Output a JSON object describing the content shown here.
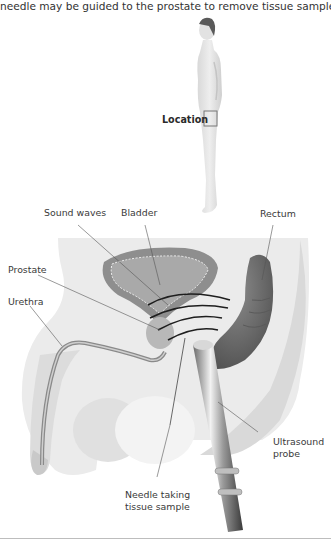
{
  "caption": "needle may be guided to the prostate to remove tissue samples.",
  "figure": {
    "location_label": "Location",
    "labels": {
      "sound_waves": "Sound waves",
      "bladder": "Bladder",
      "rectum": "Rectum",
      "prostate": "Prostate",
      "urethra": "Urethra",
      "ultrasound_probe_line1": "Ultrasound",
      "ultrasound_probe_line2": "probe",
      "needle_line1": "Needle taking",
      "needle_line2": "tissue sample"
    },
    "colors": {
      "body_fill": "#e6e6e6",
      "tissue_fill": "#d2d2d2",
      "organ_fill": "#8a8a8a",
      "rectum_fill": "#6f6f6f",
      "wave_stroke": "#1e1e1e",
      "leader_stroke": "#555555"
    }
  }
}
